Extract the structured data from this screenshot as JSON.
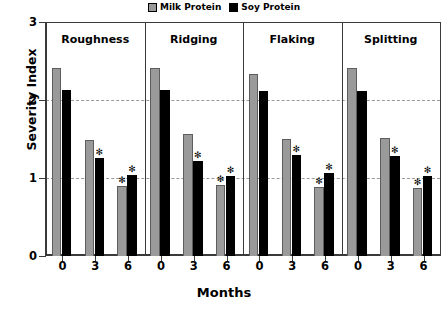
{
  "chart_data": {
    "type": "bar",
    "title": "",
    "xlabel": "Months",
    "ylabel": "Severity Index",
    "ylim": [
      0,
      3
    ],
    "yticks": [
      0,
      1,
      2,
      3
    ],
    "gridlines": [
      1,
      2
    ],
    "grid": "horizontal-dashed",
    "legend_position": "top-center",
    "categories": [
      "0",
      "3",
      "6"
    ],
    "panels": [
      {
        "name": "Roughness",
        "series": [
          {
            "name": "Milk Protein",
            "values": [
              2.41,
              1.49,
              0.9
            ],
            "significance": [
              "",
              "",
              "*"
            ]
          },
          {
            "name": "Soy Protein",
            "values": [
              2.13,
              1.26,
              1.04
            ],
            "significance": [
              "",
              "*",
              "*"
            ]
          }
        ]
      },
      {
        "name": "Ridging",
        "series": [
          {
            "name": "Milk Protein",
            "values": [
              2.41,
              1.57,
              0.91
            ],
            "significance": [
              "",
              "",
              "*"
            ]
          },
          {
            "name": "Soy Protein",
            "values": [
              2.13,
              1.22,
              1.03
            ],
            "significance": [
              "",
              "*",
              "*"
            ]
          }
        ]
      },
      {
        "name": "Flaking",
        "series": [
          {
            "name": "Milk Protein",
            "values": [
              2.33,
              1.5,
              0.89
            ],
            "significance": [
              "",
              "",
              "*"
            ]
          },
          {
            "name": "Soy Protein",
            "values": [
              2.12,
              1.29,
              1.06
            ],
            "significance": [
              "",
              "*",
              "*"
            ]
          }
        ]
      },
      {
        "name": "Splitting",
        "series": [
          {
            "name": "Milk Protein",
            "values": [
              2.41,
              1.51,
              0.87
            ],
            "significance": [
              "",
              "",
              "*"
            ]
          },
          {
            "name": "Soy Protein",
            "values": [
              2.12,
              1.28,
              1.03
            ],
            "significance": [
              "",
              "*",
              "*"
            ]
          }
        ]
      }
    ],
    "colors": {
      "milk": "#9a9a9a",
      "soy": "#000000",
      "axis": "#3a3a3a",
      "grid": "#9a9a9a"
    },
    "legend": [
      {
        "label": "Milk Protein",
        "key": "milk"
      },
      {
        "label": "Soy Protein",
        "key": "soy"
      }
    ],
    "significance_marker": "✻"
  }
}
